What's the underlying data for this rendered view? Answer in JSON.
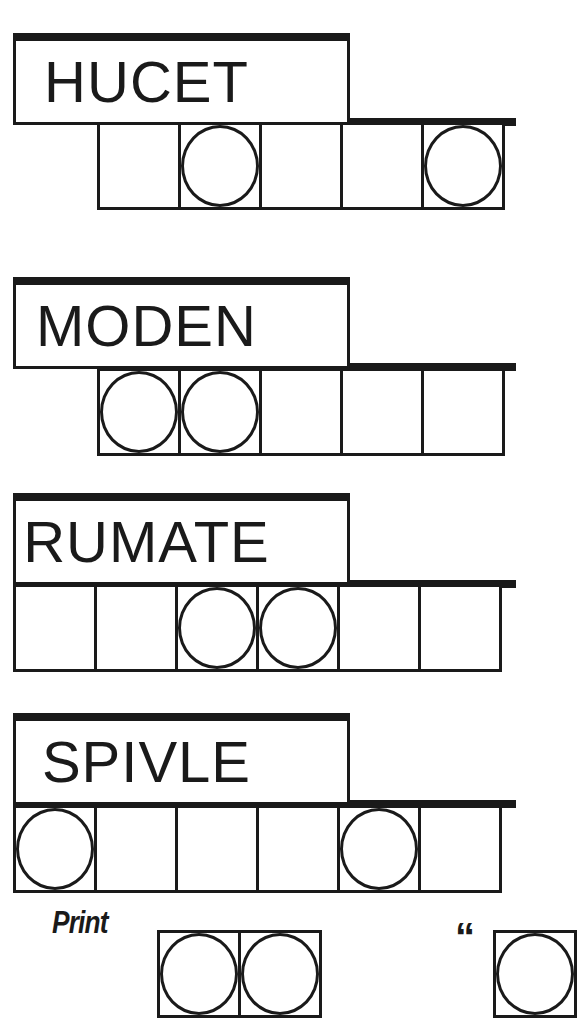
{
  "puzzle_type": "jumble",
  "colors": {
    "ink": "#1a1a1a",
    "background": "#ffffff"
  },
  "words": [
    {
      "scrambled": "HUCET",
      "letter_count": 5,
      "circled_positions": [
        2,
        5
      ]
    },
    {
      "scrambled": "MODEN",
      "letter_count": 5,
      "circled_positions": [
        1,
        2
      ]
    },
    {
      "scrambled": "RUMATE",
      "letter_count": 6,
      "circled_positions": [
        3,
        4
      ]
    },
    {
      "scrambled": "SPIVLE",
      "letter_count": 6,
      "circled_positions": [
        1,
        5
      ]
    }
  ],
  "answer_section": {
    "label": "Print",
    "open_quote": "“",
    "visible_group_1_cells": 2,
    "visible_group_2_cells": 1
  }
}
